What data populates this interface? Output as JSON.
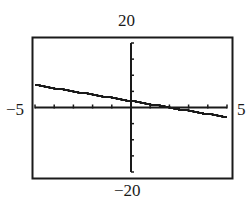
{
  "window": {
    "ymax_label": "20",
    "ymin_label": "−20",
    "xmin_label": "−5",
    "xmax_label": "5"
  },
  "colors": {
    "ink": "#1a1a1a",
    "background": "#ffffff"
  },
  "chart_data": {
    "type": "line",
    "title": "",
    "xlabel": "",
    "ylabel": "",
    "xlim": [
      -5,
      5
    ],
    "ylim": [
      -20,
      20
    ],
    "x_ticks_step": 1,
    "y_ticks_step": 5,
    "grid": false,
    "legend": null,
    "series": [
      {
        "name": "y = -x + 2 (approx.)",
        "x": [
          -5,
          -4,
          -3,
          -2,
          -1,
          0,
          1,
          2,
          3,
          4,
          5
        ],
        "y": [
          7,
          6,
          5,
          4,
          3,
          2,
          1,
          0,
          -1,
          -2,
          -3
        ]
      }
    ],
    "tick_labels": {
      "top": "20",
      "bottom": "−20",
      "left": "−5",
      "right": "5"
    }
  }
}
